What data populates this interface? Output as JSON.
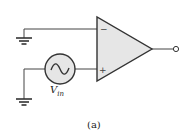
{
  "diagram": {
    "type": "op-amp circuit",
    "source_label": "V",
    "source_subscript": "in",
    "caption": "(a)",
    "inverting_input_symbol": "−",
    "noninverting_input_symbol": "+",
    "colors": {
      "wire": "#444444",
      "fill": "#e6e6e6",
      "outline": "#333333"
    },
    "components": [
      {
        "name": "op-amp",
        "inputs": [
          "inverting",
          "non-inverting"
        ],
        "output": "output-terminal"
      },
      {
        "name": "ac-voltage-source",
        "label": "Vin",
        "connected_to": "non-inverting"
      },
      {
        "name": "ground",
        "connected_to": "inverting"
      },
      {
        "name": "ground",
        "connected_to": "ac-voltage-source"
      }
    ]
  }
}
